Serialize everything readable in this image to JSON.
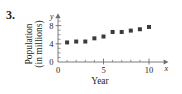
{
  "exercise": {
    "number": "3."
  },
  "chart_data": {
    "type": "scatter",
    "title": "",
    "xlabel": "Year",
    "ylabel": "Population (in millions)",
    "ylabel_line1": "Population",
    "ylabel_line2": "(in millions)",
    "axis_symbol_x": "x",
    "axis_symbol_y": "y",
    "x": [
      1,
      2,
      3,
      4,
      5,
      6,
      7,
      8,
      9,
      10
    ],
    "values": [
      4.3,
      4.5,
      4.5,
      5.2,
      5.6,
      6.6,
      6.6,
      6.9,
      7.2,
      7.7
    ],
    "xticks": [
      0,
      5,
      10
    ],
    "xtick_labels": [
      "0",
      "5",
      "10"
    ],
    "yticks": [
      0,
      4,
      8
    ],
    "ytick_labels": [
      "0",
      "4",
      "8"
    ],
    "x_minor_ticks": [
      1,
      2,
      3,
      4,
      6,
      7,
      8,
      9
    ],
    "y_minor_ticks": [
      1,
      2,
      3,
      5,
      6,
      7,
      9
    ],
    "xlim": [
      0,
      11.6
    ],
    "ylim": [
      0,
      9.6
    ],
    "grid": false,
    "legend": false,
    "marker": "square",
    "marker_color": "#3b3b3b",
    "axis_color": "#6d6d6d",
    "text_color": "#262626"
  }
}
